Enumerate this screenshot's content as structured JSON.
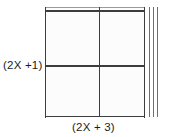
{
  "diagram": {
    "type": "area-model-rectangle",
    "title": "",
    "background_color": "#ffffff",
    "line_color": "#3d3d3d",
    "fill_color": "#fcfcfc",
    "labels": {
      "height_label": "(2X +1)",
      "width_label": "(2X + 3)"
    },
    "geometry": {
      "box_left": 45,
      "box_top": 7,
      "box_width": 100,
      "box_height": 110,
      "vertical_divider_x": 99,
      "horizontal_divider_y": 65,
      "unit_strip_x": [
        149,
        153,
        157
      ],
      "unit_strip_count": 3
    }
  }
}
